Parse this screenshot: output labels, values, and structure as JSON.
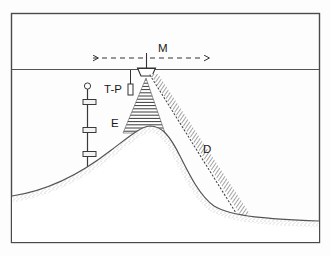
{
  "figure": {
    "frame": {
      "x": 11,
      "y": 13,
      "width": 309,
      "height": 230,
      "stroke_color": "#4a4a4a",
      "background_color": "#fdfdfd"
    },
    "sea_surface": {
      "label": "sea-surface-line",
      "y": 69,
      "stroke_color": "#555555"
    },
    "vessel": {
      "name": "research-vessel",
      "x": 146,
      "y": 69,
      "mast_top_y": 55,
      "hull_width": 18,
      "hull_depth": 7,
      "stroke_color": "#333333"
    },
    "labels": [
      {
        "id": "M",
        "text": "M",
        "x": 160,
        "y": 51,
        "desc": "mooring-survey-extent"
      },
      {
        "id": "T-P",
        "text": "T-P",
        "x": 105,
        "y": 92,
        "desc": "temperature-pressure-sensor"
      },
      {
        "id": "E",
        "text": "E",
        "x": 112,
        "y": 125,
        "desc": "acoustic-plume-envelope"
      },
      {
        "id": "D",
        "text": "D",
        "x": 205,
        "y": 152,
        "desc": "dispersal-hatched-band"
      }
    ],
    "extent_arrow": {
      "name": "m-extent-dashed-arrow",
      "y": 58,
      "x_left": 92,
      "x_right": 205,
      "center_x": 146,
      "dash_pattern": "5,4",
      "stroke_color": "#333333"
    },
    "tp_instrument": {
      "name": "tp-sensor-body",
      "x": 128,
      "y": 84,
      "width": 5,
      "height": 11,
      "tether_top_y": 70,
      "stroke_color": "#333333"
    },
    "plume_cone": {
      "name": "acoustic-plume-cone",
      "apex_x": 146,
      "apex_y": 78,
      "base_y": 133,
      "base_left_x": 123,
      "base_right_x": 165,
      "hatch_line_count": 17,
      "stroke_color": "#3a3a3a"
    },
    "dotted_beam": {
      "name": "acoustic-beam-dotted",
      "x1": 148,
      "y1": 74,
      "x2": 236,
      "y2": 213,
      "stroke_color": "#444444"
    },
    "dispersal_band": {
      "name": "dispersal-hatched-band",
      "x1": 152,
      "y1": 75,
      "x2": 243,
      "y2": 214,
      "width": 9,
      "hatch_count": 60,
      "stroke_color": "#555555"
    },
    "mooring": {
      "name": "instrument-mooring",
      "line_x": 87,
      "top_y": 88,
      "bottom_y": 170,
      "float": {
        "name": "mooring-float",
        "cx": 87,
        "cy": 86,
        "r": 3
      },
      "instruments": [
        {
          "name": "current-meter-1",
          "x": 83,
          "y": 99,
          "width": 13,
          "height": 5
        },
        {
          "name": "current-meter-2",
          "x": 83,
          "y": 127,
          "width": 13,
          "height": 5
        },
        {
          "name": "current-meter-3",
          "x": 83,
          "y": 151,
          "width": 13,
          "height": 5
        }
      ],
      "stroke_color": "#3a3a3a"
    },
    "seafloor": {
      "name": "seafloor-profile",
      "stroke_color": "#555555",
      "stipple_color": "#9a9a9a",
      "path": "M 12,196 C 45,191 78,176 110,151 C 130,136 140,127 150,126 C 162,126 170,136 180,156 C 190,176 200,196 214,206 C 232,217 270,219 319,221",
      "crest_x": 150,
      "crest_y": 126
    }
  },
  "caption": {
    "visible": false,
    "text": ""
  }
}
